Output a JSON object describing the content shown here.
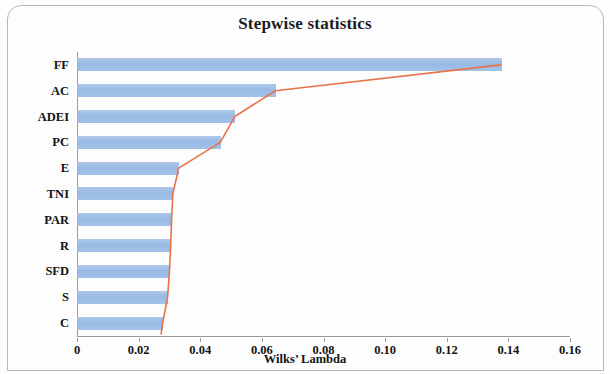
{
  "figure": {
    "title": "Stepwise statistics",
    "xaxis_title": "Wilks’  Lambda",
    "bar_color": "#8FB4E3",
    "line_color": "#E8734A",
    "axis_color": "#9A9A9A"
  },
  "chart_data": {
    "type": "bar",
    "title": "Stepwise statistics",
    "xlabel": "Wilks’  Lambda",
    "ylabel": "",
    "orientation": "horizontal",
    "xlim": [
      0,
      0.16
    ],
    "grid": false,
    "legend": "none",
    "xticks": [
      "0",
      "0.02",
      "0.04",
      "0.06",
      "0.08",
      "0.10",
      "0.12",
      "0.14",
      "0.16"
    ],
    "xtick_values": [
      0,
      0.02,
      0.04,
      0.06,
      0.08,
      0.1,
      0.12,
      0.14,
      0.16
    ],
    "categories": [
      "FF",
      "AC",
      "ADEI",
      "PC",
      "E",
      "TNI",
      "PAR",
      "R",
      "SFD",
      "S",
      "C"
    ],
    "values": [
      0.138,
      0.0646,
      0.0513,
      0.0467,
      0.0331,
      0.0312,
      0.0308,
      0.0305,
      0.0301,
      0.0295,
      0.0279
    ],
    "series": [
      {
        "name": "Wilks' Lambda bars",
        "type": "bar",
        "values": [
          0.138,
          0.0646,
          0.0513,
          0.0467,
          0.0331,
          0.0312,
          0.0308,
          0.0305,
          0.0301,
          0.0295,
          0.0279
        ]
      },
      {
        "name": "Wilks' Lambda line",
        "type": "line",
        "values": [
          0.1375,
          0.0644,
          0.0512,
          0.0465,
          0.033,
          0.0311,
          0.0307,
          0.0304,
          0.03,
          0.0294,
          0.0278
        ]
      }
    ]
  }
}
